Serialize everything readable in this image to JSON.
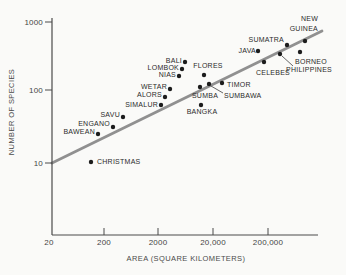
{
  "figure": {
    "width": 346,
    "height": 275,
    "background": "#fafaf8",
    "axis_color": "#4a4a4a",
    "text_color": "#2b2b2b",
    "dot_color": "#1c1c1c",
    "dot_radius": 2.2,
    "trend_color": "#909090",
    "trend_width": 2.8,
    "leader_color": "#555555"
  },
  "y_axis": {
    "title": "NUMBER OF SPECIES",
    "line": {
      "x": 52,
      "y1": 18,
      "y2": 235
    },
    "ticks": [
      {
        "label": "1000",
        "y": 22
      },
      {
        "label": "100",
        "y": 90
      },
      {
        "label": "10",
        "y": 163
      }
    ]
  },
  "x_axis": {
    "title": "AREA (SQUARE KILOMETERS)",
    "line": {
      "y": 235,
      "x1": 52,
      "x2": 318
    },
    "ticks": [
      {
        "label": "20",
        "x": 49,
        "dash": false
      },
      {
        "label": "200",
        "x": 104,
        "dash": true
      },
      {
        "label": "2000",
        "x": 158,
        "dash": true
      },
      {
        "label": "20,000",
        "x": 213,
        "dash": true
      },
      {
        "label": "200,000",
        "x": 268,
        "dash": true
      }
    ]
  },
  "trend_line": {
    "x1": 52,
    "y1": 163,
    "x2": 322,
    "y2": 31
  },
  "islands": [
    {
      "name": "CHRISTMAS",
      "dot": {
        "x": 91,
        "y": 162
      },
      "label": {
        "lines": [
          "CHRISTMAS"
        ],
        "x": 97,
        "y": 162,
        "align": "start"
      }
    },
    {
      "name": "BAWEAN",
      "dot": {
        "x": 98,
        "y": 134
      },
      "label": {
        "lines": [
          "BAWEAN"
        ],
        "x": 95,
        "y": 132,
        "align": "end"
      }
    },
    {
      "name": "ENGANO",
      "dot": {
        "x": 113,
        "y": 127
      },
      "label": {
        "lines": [
          "ENGANO"
        ],
        "x": 110,
        "y": 124,
        "align": "end"
      }
    },
    {
      "name": "SAVU",
      "dot": {
        "x": 123,
        "y": 117
      },
      "label": {
        "lines": [
          "SAVU"
        ],
        "x": 120,
        "y": 115,
        "align": "end"
      }
    },
    {
      "name": "SIMALUR",
      "dot": {
        "x": 161,
        "y": 105
      },
      "label": {
        "lines": [
          "SIMALUR"
        ],
        "x": 158,
        "y": 105,
        "align": "end"
      }
    },
    {
      "name": "ALORS",
      "dot": {
        "x": 165,
        "y": 97
      },
      "label": {
        "lines": [
          "ALORS"
        ],
        "x": 162,
        "y": 95,
        "align": "end"
      }
    },
    {
      "name": "WETAR",
      "dot": {
        "x": 170,
        "y": 89
      },
      "label": {
        "lines": [
          "WETAR"
        ],
        "x": 167,
        "y": 87,
        "align": "end"
      }
    },
    {
      "name": "NIAS",
      "dot": {
        "x": 179,
        "y": 76
      },
      "label": {
        "lines": [
          "NIAS"
        ],
        "x": 176,
        "y": 75,
        "align": "end"
      }
    },
    {
      "name": "LOMBOK",
      "dot": {
        "x": 182,
        "y": 69
      },
      "label": {
        "lines": [
          "LOMBOK"
        ],
        "x": 179,
        "y": 68,
        "align": "end"
      }
    },
    {
      "name": "BALI",
      "dot": {
        "x": 185,
        "y": 62
      },
      "label": {
        "lines": [
          "BALI"
        ],
        "x": 182,
        "y": 61,
        "align": "end"
      }
    },
    {
      "name": "SUMBA",
      "dot": {
        "x": 200,
        "y": 87
      },
      "label": {
        "lines": [
          "SUMBA"
        ],
        "x": 205,
        "y": 96,
        "align": "middle"
      }
    },
    {
      "name": "BANGKA",
      "dot": {
        "x": 201,
        "y": 105
      },
      "label": {
        "lines": [
          "BANGKA"
        ],
        "x": 202,
        "y": 112,
        "align": "middle"
      }
    },
    {
      "name": "FLORES",
      "dot": {
        "x": 204,
        "y": 75
      },
      "label": {
        "lines": [
          "FLORES"
        ],
        "x": 208,
        "y": 66,
        "align": "middle"
      }
    },
    {
      "name": "SUMBAWA",
      "dot": {
        "x": 209,
        "y": 84
      },
      "label": {
        "lines": [
          "SUMBAWA"
        ],
        "x": 224,
        "y": 96,
        "align": "start"
      },
      "leader": {
        "x1": 211,
        "y1": 86,
        "x2": 223,
        "y2": 93
      }
    },
    {
      "name": "TIMOR",
      "dot": {
        "x": 222,
        "y": 83
      },
      "label": {
        "lines": [
          "TIMOR"
        ],
        "x": 227,
        "y": 85,
        "align": "start"
      }
    },
    {
      "name": "JAVA",
      "dot": {
        "x": 258,
        "y": 51
      },
      "label": {
        "lines": [
          "JAVA"
        ],
        "x": 256,
        "y": 51,
        "align": "end"
      }
    },
    {
      "name": "CELEBES",
      "dot": {
        "x": 264,
        "y": 62
      },
      "label": {
        "lines": [
          "CELEBES"
        ],
        "x": 273,
        "y": 73,
        "align": "middle"
      }
    },
    {
      "name": "PHILIPPINES",
      "dot": {
        "x": 280,
        "y": 54
      },
      "label": {
        "lines": [
          "PHILIPPINES"
        ],
        "x": 309,
        "y": 70,
        "align": "middle"
      },
      "leader": {
        "x1": 282,
        "y1": 56,
        "x2": 293,
        "y2": 66
      }
    },
    {
      "name": "SUMATRA",
      "dot": {
        "x": 287,
        "y": 45
      },
      "label": {
        "lines": [
          "SUMATRA"
        ],
        "x": 284,
        "y": 40,
        "align": "end"
      }
    },
    {
      "name": "BORNEO",
      "dot": {
        "x": 300,
        "y": 52
      },
      "label": {
        "lines": [
          "BORNEO"
        ],
        "x": 311,
        "y": 62,
        "align": "middle"
      }
    },
    {
      "name": "NEW GUINEA",
      "dot": {
        "x": 305,
        "y": 41
      },
      "label": {
        "lines": [
          "NEW",
          "GUINEA"
        ],
        "x": 318,
        "y": 23,
        "align": "end"
      }
    }
  ],
  "chart_data": {
    "type": "scatter",
    "title": "",
    "xlabel": "AREA (SQUARE KILOMETERS)",
    "ylabel": "NUMBER OF SPECIES",
    "x_scale": "log",
    "y_scale": "log",
    "x_ticks": [
      20,
      200,
      2000,
      20000,
      200000
    ],
    "y_ticks": [
      10,
      100,
      1000
    ],
    "x_range": [
      20,
      2000000
    ],
    "y_range": [
      5,
      1000
    ],
    "trend_line": {
      "description": "species-area regression line",
      "x": [
        20,
        1900000
      ],
      "y": [
        10,
        650
      ]
    },
    "points": [
      {
        "name": "CHRISTMAS",
        "area_km2": 115,
        "species": 12
      },
      {
        "name": "BAWEAN",
        "area_km2": 150,
        "species": 27
      },
      {
        "name": "ENGANO",
        "area_km2": 275,
        "species": 33
      },
      {
        "name": "SAVU",
        "area_km2": 440,
        "species": 45
      },
      {
        "name": "SIMALUR",
        "area_km2": 2200,
        "species": 64
      },
      {
        "name": "ALORS",
        "area_km2": 2600,
        "species": 80
      },
      {
        "name": "WETAR",
        "area_km2": 3200,
        "species": 100
      },
      {
        "name": "NIAS",
        "area_km2": 4700,
        "species": 160
      },
      {
        "name": "LOMBOK",
        "area_km2": 5300,
        "species": 205
      },
      {
        "name": "BALI",
        "area_km2": 6000,
        "species": 260
      },
      {
        "name": "SUMBA",
        "area_km2": 11000,
        "species": 110
      },
      {
        "name": "BANGKA",
        "area_km2": 12000,
        "species": 64
      },
      {
        "name": "FLORES",
        "area_km2": 13500,
        "species": 165
      },
      {
        "name": "SUMBAWA",
        "area_km2": 16000,
        "species": 125
      },
      {
        "name": "TIMOR",
        "area_km2": 29000,
        "species": 125
      },
      {
        "name": "JAVA",
        "area_km2": 135000,
        "species": 380
      },
      {
        "name": "CELEBES",
        "area_km2": 175000,
        "species": 250
      },
      {
        "name": "PHILIPPINES",
        "area_km2": 330000,
        "species": 330
      },
      {
        "name": "SUMATRA",
        "area_km2": 450000,
        "species": 485
      },
      {
        "name": "BORNEO",
        "area_km2": 800000,
        "species": 350
      },
      {
        "name": "NEW GUINEA",
        "area_km2": 1000000,
        "species": 540
      }
    ]
  }
}
